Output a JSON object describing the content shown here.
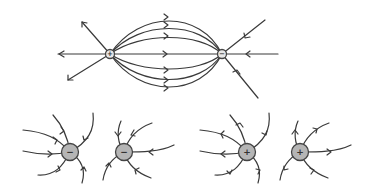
{
  "diagram": {
    "dipole": {
      "left_charge": {
        "sign": "+",
        "label": "positive-charge"
      },
      "right_charge": {
        "sign": "−",
        "label": "negative-charge"
      },
      "field_direction": "from positive to negative"
    },
    "isolated_charges": [
      {
        "sign": "−",
        "field_direction": "inward"
      },
      {
        "sign": "−",
        "field_direction": "inward"
      },
      {
        "sign": "+",
        "field_direction": "outward"
      },
      {
        "sign": "+",
        "field_direction": "outward"
      }
    ]
  }
}
